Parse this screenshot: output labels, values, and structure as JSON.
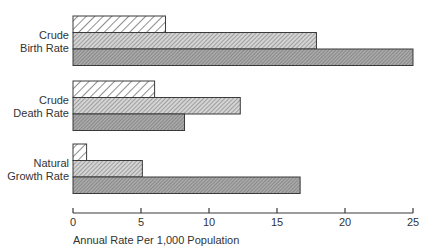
{
  "chart_data": {
    "type": "bar",
    "orientation": "horizontal",
    "title": "",
    "xlabel": "Annual Rate Per 1,000 Population",
    "ylabel": "",
    "xlim": [
      0,
      25
    ],
    "xticks": [
      0,
      5,
      10,
      15,
      20,
      25
    ],
    "grid": false,
    "legend": null,
    "categories": [
      {
        "label_lines": [
          "Crude",
          "Birth Rate"
        ]
      },
      {
        "label_lines": [
          "Crude",
          "Death Rate"
        ]
      },
      {
        "label_lines": [
          "Natural",
          "Growth Rate"
        ]
      }
    ],
    "series": [
      {
        "name": "Series 1 (sparse diagonal hatch)",
        "pattern": "hatch-light",
        "values": [
          6.8,
          6.0,
          1.0
        ]
      },
      {
        "name": "Series 2 (dense diagonal hatch)",
        "pattern": "hatch-medium",
        "values": [
          17.9,
          12.3,
          5.1
        ]
      },
      {
        "name": "Series 3 (dark dense hatch)",
        "pattern": "hatch-dark",
        "values": [
          25.0,
          8.2,
          16.7
        ]
      }
    ]
  },
  "colors": {
    "outline": "#3a3a3a",
    "hatch_light_bg": "#ffffff",
    "hatch_medium_bg": "#c8c8c8",
    "hatch_dark_bg": "#9a9a9a"
  }
}
